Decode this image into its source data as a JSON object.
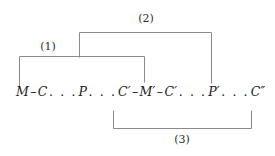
{
  "figure": {
    "background_color": "#ffffff",
    "line_color": "#8a8a8a",
    "text_color": "#222222"
  },
  "sequence": {
    "full_text": "M – C . . . P . . . C′ – M′ – C′ . . . P′ . . . C″",
    "tokens": [
      {
        "type": "symbol",
        "text": "M"
      },
      {
        "type": "dash",
        "text": "–"
      },
      {
        "type": "symbol",
        "text": "C"
      },
      {
        "type": "ellipsis",
        "text": ". . ."
      },
      {
        "type": "symbol",
        "text": "P"
      },
      {
        "type": "ellipsis",
        "text": ". . ."
      },
      {
        "type": "symbol",
        "text": "C′"
      },
      {
        "type": "dash",
        "text": "–"
      },
      {
        "type": "symbol",
        "text": "M′"
      },
      {
        "type": "dash",
        "text": "–"
      },
      {
        "type": "symbol",
        "text": "C′"
      },
      {
        "type": "ellipsis",
        "text": ". . ."
      },
      {
        "type": "symbol",
        "text": "P′"
      },
      {
        "type": "ellipsis",
        "text": ". . ."
      },
      {
        "type": "symbol",
        "text": "C″"
      }
    ]
  },
  "brackets": [
    {
      "id": "bracket-1",
      "label": "(1)",
      "orientation": "down",
      "label_x": 48,
      "label_y": 41,
      "path": "M 19.5 88 L 19.5 56.5 L 144.5 56.5 L 144.5 82"
    },
    {
      "id": "bracket-2",
      "label": "(2)",
      "orientation": "down",
      "label_x": 146,
      "label_y": 13,
      "path": "M 79.5 57 L 79.5 32.5 L 211.5 32.5 L 211.5 83"
    },
    {
      "id": "bracket-3",
      "label": "(3)",
      "orientation": "up",
      "label_x": 182,
      "label_y": 134,
      "path": "M 113.5 111 L 113.5 128.5 L 251.5 128.5 L 251.5 111"
    }
  ]
}
